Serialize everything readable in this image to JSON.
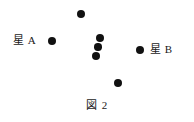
{
  "figure": {
    "caption": "図 2",
    "caption_x": 0,
    "caption_y": 99,
    "width": 194,
    "height": 122,
    "background_color": "#ffffff",
    "dot_color": "#111111",
    "text_color": "#1a1a1a"
  },
  "labels": [
    {
      "id": "star-a",
      "text": "星 A",
      "x": 13,
      "y": 34
    },
    {
      "id": "star-b",
      "text": "星 B",
      "x": 150,
      "y": 43
    }
  ],
  "chart_data": {
    "type": "scatter",
    "title": "図 2",
    "xlabel": "",
    "ylabel": "",
    "grid": false,
    "legend": "none",
    "xlim": [
      0,
      194
    ],
    "ylim": [
      0,
      122
    ],
    "annotations": [
      {
        "text": "星 A",
        "x": 13,
        "y": 40,
        "target": "star-a-dot"
      },
      {
        "text": "星 B",
        "x": 150,
        "y": 49,
        "target": "star-b-dot"
      },
      {
        "text": "図 2",
        "x": 96,
        "y": 106,
        "target": "caption"
      }
    ],
    "points": [
      {
        "name": "star-a-dot",
        "x": 52,
        "y": 41,
        "r": 4.0
      },
      {
        "name": "star-b-dot",
        "x": 140,
        "y": 50,
        "r": 4.0
      },
      {
        "name": "cluster-top-dot",
        "x": 81,
        "y": 14,
        "r": 4.0
      },
      {
        "name": "cluster-mid-1",
        "x": 100,
        "y": 38,
        "r": 4.0
      },
      {
        "name": "cluster-mid-2",
        "x": 98,
        "y": 47,
        "r": 3.7
      },
      {
        "name": "cluster-mid-3",
        "x": 96,
        "y": 56,
        "r": 4.0
      },
      {
        "name": "cluster-low-dot",
        "x": 118,
        "y": 83,
        "r": 4.0
      }
    ]
  }
}
